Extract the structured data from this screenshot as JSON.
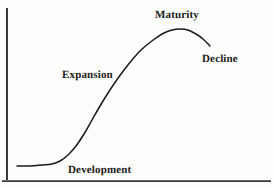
{
  "figure": {
    "name": "life-cycle-curve",
    "background_color": "#fdfdfb",
    "axis_color": "#3a3a3a",
    "curve_color": "#1a1a1a"
  },
  "labels": {
    "maturity": "Maturity",
    "decline": "Decline",
    "expansion": "Expansion",
    "development": "Development"
  },
  "chart_data": {
    "type": "line",
    "title": "",
    "xlabel": "",
    "ylabel": "",
    "grid": false,
    "legend": "none",
    "xlim": [
      0,
      273
    ],
    "ylim": [
      188,
      0
    ],
    "axes": {
      "y_axis": {
        "x": 7,
        "y_top": 8,
        "y_bottom": 180
      },
      "x_axis": {
        "y": 181,
        "x_left": 2,
        "x_right": 271
      }
    },
    "series": [
      {
        "name": "Life cycle S-curve",
        "points": [
          [
            17,
            166
          ],
          [
            30,
            166
          ],
          [
            42,
            165
          ],
          [
            52,
            164
          ],
          [
            60,
            161
          ],
          [
            68,
            155
          ],
          [
            76,
            146
          ],
          [
            84,
            134
          ],
          [
            92,
            120
          ],
          [
            100,
            106
          ],
          [
            108,
            93
          ],
          [
            116,
            81
          ],
          [
            124,
            70
          ],
          [
            132,
            60
          ],
          [
            140,
            51
          ],
          [
            148,
            44
          ],
          [
            156,
            38
          ],
          [
            164,
            33
          ],
          [
            172,
            30
          ],
          [
            180,
            29
          ],
          [
            188,
            30
          ],
          [
            196,
            34
          ],
          [
            203,
            39
          ],
          [
            210,
            46
          ]
        ],
        "annotations": [
          {
            "text": "Development",
            "stage": 1,
            "x": 68,
            "y": 170
          },
          {
            "text": "Expansion",
            "stage": 2,
            "x": 62,
            "y": 75
          },
          {
            "text": "Maturity",
            "stage": 3,
            "x": 155,
            "y": 15
          },
          {
            "text": "Decline",
            "stage": 4,
            "x": 202,
            "y": 59
          }
        ]
      }
    ]
  }
}
